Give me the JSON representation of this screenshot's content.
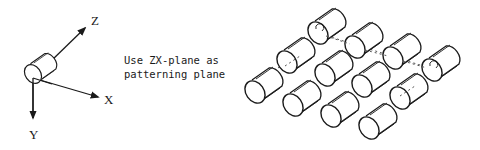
{
  "axes": {
    "z_label": "Z",
    "x_label": "X",
    "y_label": "Y"
  },
  "note": {
    "line1": "Use ZX-plane as",
    "line2": "patterning plane"
  },
  "pattern": {
    "rows": 3,
    "columns": 4,
    "instance_count": 12,
    "highlighted_instances": [
      "row1-col1",
      "row1-col4"
    ],
    "dashed_axes": [
      "row1",
      "row2-col1",
      "row1-col4-to-row2-col4"
    ]
  },
  "colors": {
    "line": "#1a1a1a",
    "background": "#ffffff",
    "dashed": "#555555"
  }
}
